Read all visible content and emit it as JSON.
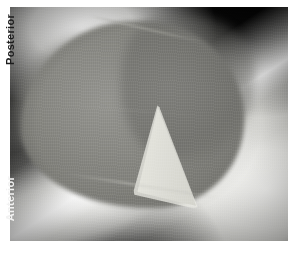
{
  "image": {
    "modality": "ultrasound-grayscale",
    "width": 297,
    "height": 253
  },
  "annotations": {
    "posterior_label": "Posterior",
    "anterior_label": "Anterior"
  },
  "colors": {
    "background": "#ffffff",
    "chamber_gray": "#85857f",
    "bright_tissue": "#f4f4f2",
    "dark_field": "#101010",
    "wedge_bright": "#d8d8d2",
    "posterior_text": "#1c1c1c",
    "anterior_text": "#f2f2f2"
  }
}
